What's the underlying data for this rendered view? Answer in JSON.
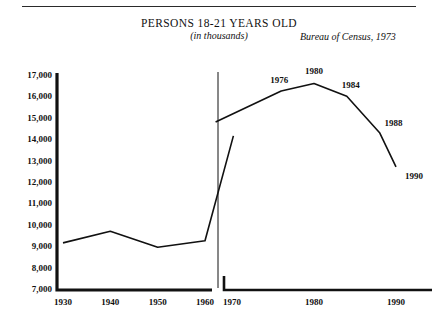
{
  "header": {
    "title": "PERSONS 18-21 YEARS OLD",
    "subtitle": "(in thousands)",
    "source": "Bureau of Census, 1973"
  },
  "chart_data": {
    "type": "line",
    "title": "PERSONS 18-21 YEARS OLD",
    "subtitle": "(in thousands)",
    "source": "Bureau of Census, 1973",
    "xlabel": "",
    "ylabel": "",
    "ylim": [
      7000,
      17000
    ],
    "ytick_step": 1000,
    "ytick_labels": [
      "17,000",
      "16,000",
      "15,000",
      "14,000",
      "13,000",
      "12,000",
      "11,000",
      "10,000",
      "9,000",
      "8,000",
      "7,000"
    ],
    "ytick_values": [
      17000,
      16000,
      15000,
      14000,
      13000,
      12000,
      11000,
      10000,
      9000,
      8000,
      7000
    ],
    "grid": false,
    "legend": false,
    "panels": [
      {
        "name": "historical",
        "xlim": [
          1930,
          1967
        ],
        "xtick_labels": [
          "1930",
          "1940",
          "1950",
          "1960"
        ],
        "xtick_values": [
          1930,
          1940,
          1950,
          1960
        ],
        "series": [
          {
            "name": "persons-18-21",
            "x": [
              1930,
              1940,
              1950,
              1960,
              1966
            ],
            "values": [
              9200,
              9750,
              9000,
              9300,
              14200
            ]
          }
        ]
      },
      {
        "name": "projected",
        "xlim": [
          1968,
          1992
        ],
        "xtick_labels": [
          "1970",
          "1980",
          "1990"
        ],
        "xtick_values": [
          1970,
          1980,
          1990
        ],
        "series": [
          {
            "name": "persons-18-21",
            "x": [
              1968,
              1976,
              1980,
              1984,
              1988,
              1990
            ],
            "values": [
              14850,
              16300,
              16650,
              16050,
              14350,
              12750
            ]
          }
        ],
        "point_labels": [
          {
            "label": "1976",
            "x": 1976,
            "value": 16300
          },
          {
            "label": "1980",
            "x": 1980,
            "value": 16650
          },
          {
            "label": "1984",
            "x": 1984,
            "value": 16050
          },
          {
            "label": "1988",
            "x": 1988,
            "value": 14350
          },
          {
            "label": "1990",
            "x": 1990,
            "value": 12750
          }
        ]
      }
    ],
    "colors": {
      "line": "#111111",
      "axis": "#111111",
      "background": "#ffffff"
    }
  }
}
